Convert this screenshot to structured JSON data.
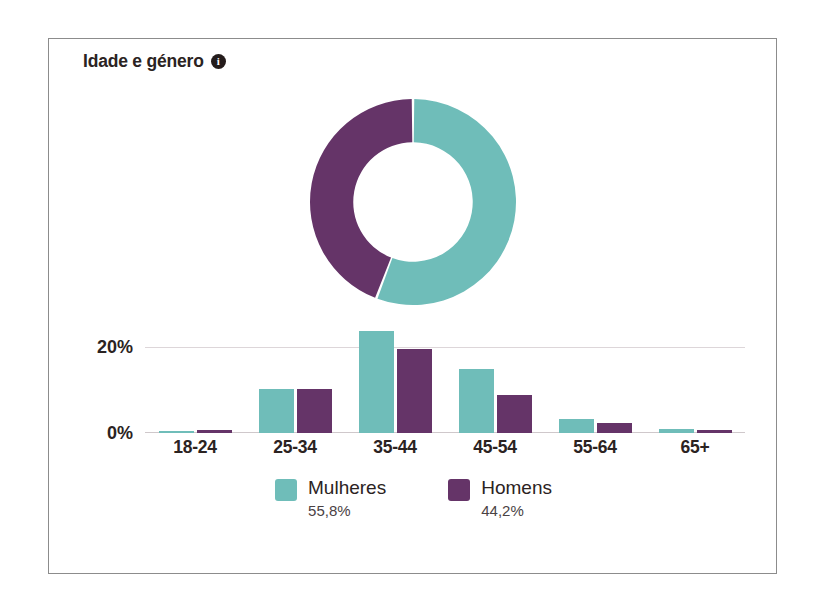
{
  "panel": {
    "title": "Idade e género",
    "info_icon": "info-icon",
    "info_glyph": "i"
  },
  "colors": {
    "female": "#6FBDB9",
    "male": "#653468",
    "gridline": "#DDD6D9",
    "border": "#8C8C8C",
    "text": "#2B2322"
  },
  "legend": {
    "items": [
      {
        "label": "Mulheres",
        "value": "55,8%",
        "color_key": "female"
      },
      {
        "label": "Homens",
        "value": "44,2%",
        "color_key": "male"
      }
    ]
  },
  "chart_data": [
    {
      "type": "pie",
      "title": "Idade e género",
      "subtype": "donut",
      "labels": [
        "Mulheres",
        "Homens"
      ],
      "values": [
        55.8,
        44.2
      ],
      "value_labels": [
        "55,8%",
        "44,2%"
      ],
      "colors": [
        "#6FBDB9",
        "#653468"
      ],
      "start_angle_deg": 0,
      "direction": "clockwise",
      "inner_radius_ratio": 0.58,
      "legend_position": "bottom"
    },
    {
      "type": "bar",
      "title": "",
      "xlabel": "",
      "ylabel": "",
      "categories": [
        "18-24",
        "25-34",
        "35-44",
        "45-54",
        "55-64",
        "65+"
      ],
      "series": [
        {
          "name": "Mulheres",
          "color": "#6FBDB9",
          "values": [
            0.5,
            10.3,
            23.7,
            14.8,
            3.2,
            0.9
          ]
        },
        {
          "name": "Homens",
          "color": "#653468",
          "values": [
            0.6,
            10.3,
            19.4,
            8.8,
            2.3,
            0.6
          ]
        }
      ],
      "ylim": [
        0,
        26
      ],
      "yticks": [
        0,
        20
      ],
      "ytick_labels": [
        "0%",
        "20%"
      ],
      "grid": true,
      "legend_position": "bottom"
    }
  ]
}
